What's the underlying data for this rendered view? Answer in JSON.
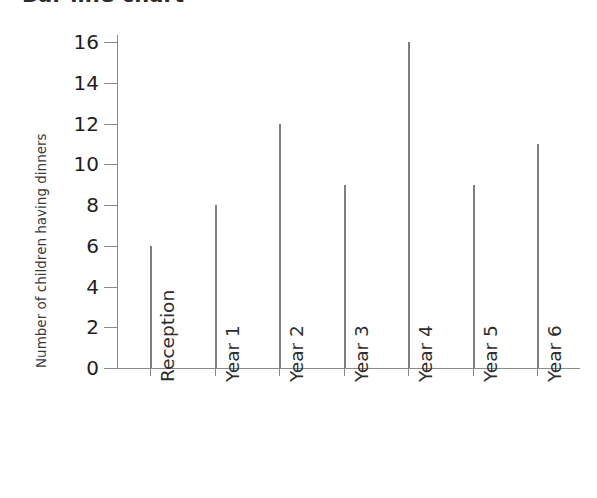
{
  "chart_data": {
    "type": "bar",
    "title": "Bar line chart",
    "xlabel": "",
    "ylabel": "Number of children having dinners",
    "categories": [
      "Reception",
      "Year 1",
      "Year 2",
      "Year 3",
      "Year 4",
      "Year 5",
      "Year 6"
    ],
    "values": [
      6,
      8,
      12,
      9,
      16,
      9,
      11
    ],
    "ylim": [
      0,
      16
    ],
    "y_ticks": [
      0,
      2,
      4,
      6,
      8,
      10,
      12,
      14,
      16
    ],
    "y_tick_labels": [
      "0",
      "2",
      "4",
      "6",
      "8",
      "10",
      "12",
      "14",
      "16"
    ],
    "grid": false,
    "legend": false,
    "legend_position": "none",
    "series_color": "#7e7e7e",
    "axis_color": "#8a8a8a",
    "text_color": "#2d2d2d",
    "background_color": "#ffffff"
  }
}
